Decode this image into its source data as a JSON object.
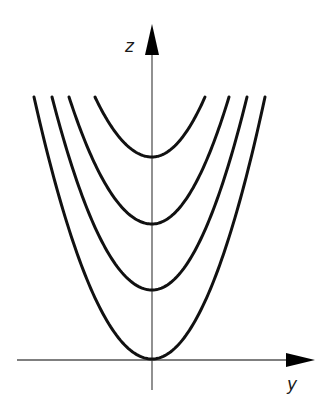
{
  "figure": {
    "axes": {
      "horizontal_label": "y",
      "vertical_label": "z",
      "color": "#555555",
      "arrow_color": "#000000"
    },
    "curve_color": "#111111",
    "curves": [
      {
        "name": "parabola-1",
        "vertex_offset": 0,
        "path": "M34,97 Q152,622 265,97"
      },
      {
        "name": "parabola-2",
        "vertex_offset": 1,
        "path": "M52,97 Q152,350 247,97"
      },
      {
        "name": "parabola-3",
        "vertex_offset": 2,
        "path": "M69,97 Q152,350 229,97"
      },
      {
        "name": "parabola-4",
        "vertex_offset": 3,
        "path": "M95,97 Q152,215 205,97"
      }
    ]
  },
  "chart_data": {
    "type": "line",
    "title": "",
    "xlabel": "y",
    "ylabel": "z",
    "series": [
      {
        "name": "z = y^2",
        "vertex": [
          0,
          0
        ]
      },
      {
        "name": "z = y^2 + 1",
        "vertex": [
          0,
          1
        ]
      },
      {
        "name": "z = y^2 + 2",
        "vertex": [
          0,
          2
        ]
      },
      {
        "name": "z = y^2 + 3",
        "vertex": [
          0,
          3
        ]
      }
    ],
    "grid": false,
    "legend": "none"
  }
}
